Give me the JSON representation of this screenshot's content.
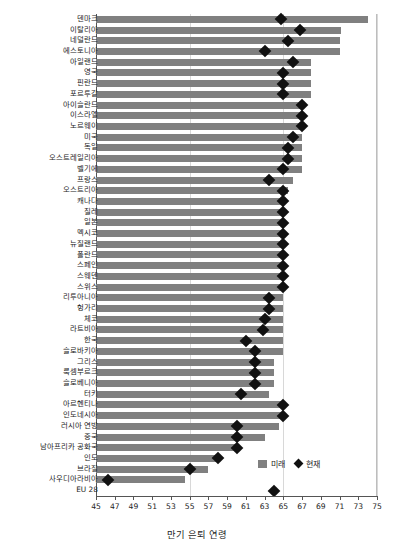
{
  "chart_data": {
    "type": "bar",
    "title": "",
    "xlabel": "만기 은퇴 연령",
    "ylabel": "",
    "xlim": [
      45,
      75
    ],
    "xticks": [
      45,
      47,
      49,
      51,
      53,
      55,
      57,
      59,
      61,
      63,
      65,
      67,
      69,
      71,
      73,
      75
    ],
    "grid": true,
    "legend_position": "bottom-right",
    "legend": [
      {
        "name": "미래",
        "marker": "bar",
        "color": "#808080"
      },
      {
        "name": "현재",
        "marker": "diamond",
        "color": "#111111"
      }
    ],
    "categories": [
      "덴마크",
      "이탈리아",
      "네덜란드",
      "에스토니아",
      "아일랜드",
      "영국",
      "핀란드",
      "포르투갈",
      "아이슬란드",
      "이스라엘",
      "노르웨이",
      "미국",
      "독일",
      "오스트레일리아",
      "벨기에",
      "프랑스",
      "오스트리아",
      "캐나다",
      "칠레",
      "일본",
      "멕시코",
      "뉴질랜드",
      "폴란드",
      "스페인",
      "스웨덴",
      "스위스",
      "리투아니아",
      "헝가리",
      "체코",
      "라트비아",
      "한국",
      "슬로바키아",
      "그리스",
      "룩셈부르크",
      "슬로베니아",
      "터키",
      "아르헨티나",
      "인도네시아",
      "러시아 연방",
      "중국",
      "남아프리카 공화국",
      "인도",
      "브라질",
      "사우디아라비아",
      "EU 28"
    ],
    "series": [
      {
        "name": "미래",
        "type": "bar",
        "values": [
          74.0,
          71.2,
          71.0,
          71.0,
          68.0,
          68.0,
          68.0,
          68.0,
          67.0,
          67.0,
          67.0,
          67.0,
          67.0,
          67.0,
          67.0,
          66.0,
          65.5,
          65.0,
          65.0,
          65.0,
          65.0,
          65.0,
          65.0,
          65.0,
          65.0,
          65.0,
          65.0,
          65.0,
          65.0,
          65.0,
          65.0,
          65.0,
          64.0,
          64.0,
          64.0,
          63.5,
          65.0,
          65.0,
          64.5,
          63.0,
          60.0,
          58.0,
          57.0,
          54.5,
          null
        ]
      },
      {
        "name": "현재",
        "type": "scatter",
        "values": [
          64.7,
          66.8,
          65.5,
          63.0,
          66.0,
          65.0,
          65.0,
          65.0,
          67.0,
          67.0,
          67.0,
          66.0,
          65.5,
          65.5,
          65.0,
          63.5,
          65.0,
          65.0,
          65.0,
          65.0,
          65.0,
          65.0,
          65.0,
          65.0,
          65.0,
          65.0,
          63.5,
          63.5,
          63.0,
          62.8,
          61.0,
          62.0,
          62.0,
          62.0,
          62.0,
          60.5,
          65.0,
          65.0,
          60.0,
          60.0,
          60.0,
          58.0,
          55.0,
          46.3,
          64.0
        ]
      }
    ]
  }
}
